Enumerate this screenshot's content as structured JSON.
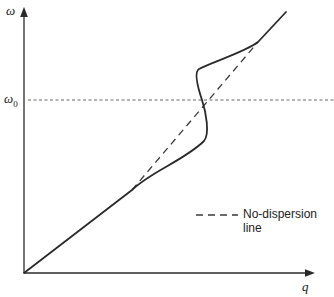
{
  "diagram": {
    "y_axis_label": "ω",
    "x_axis_label": "q",
    "reference_level_label": "ω",
    "reference_level_subscript": "0",
    "legend": {
      "entries": [
        {
          "style": "dashed",
          "label": "No-dispersion line"
        }
      ]
    },
    "curves": [
      {
        "name": "dispersion-curve",
        "style": "solid",
        "description": "Linear at low and high q, with S-shaped avoided crossing near ω0"
      },
      {
        "name": "no-dispersion-line",
        "style": "dashed",
        "description": "Straight line connecting the linear segments"
      },
      {
        "name": "omega0-line",
        "style": "fine-dashed",
        "description": "Horizontal reference line at ω0"
      }
    ],
    "colors": {
      "curve": "#2a2a2a",
      "axis": "#2a2a2a",
      "reference": "#555555"
    }
  }
}
